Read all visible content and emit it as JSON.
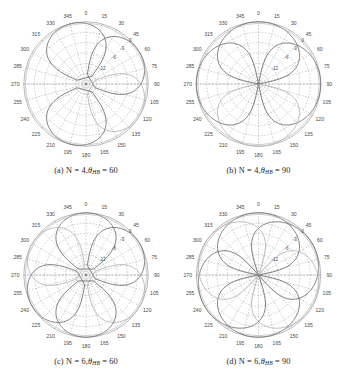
{
  "figure": {
    "panels": [
      {
        "tag": "(a)",
        "caption_text": "(a)  N = 4, θHB = 60",
        "caption_prefix": "(a)",
        "caption_n": "N = 4,",
        "caption_theta": "θ",
        "caption_sub": "HB",
        "caption_value": "= 60",
        "N": 4,
        "theta_HB": 60
      },
      {
        "tag": "(b)",
        "caption_text": "(b)  N = 4, θHB = 90",
        "caption_prefix": "(b)",
        "caption_n": "N = 4,",
        "caption_theta": "θ",
        "caption_sub": "HB",
        "caption_value": "= 90",
        "N": 4,
        "theta_HB": 90
      },
      {
        "tag": "(c)",
        "caption_text": "(c)  N = 6, θHB = 60",
        "caption_prefix": "(c)",
        "caption_n": "N = 6,",
        "caption_theta": "θ",
        "caption_sub": "HB",
        "caption_value": "= 60",
        "N": 6,
        "theta_HB": 60
      },
      {
        "tag": "(d)",
        "caption_text": "(d)  N = 6, θHB = 90",
        "caption_prefix": "(d)",
        "caption_n": "N = 6,",
        "caption_theta": "θ",
        "caption_sub": "HB",
        "caption_value": "= 90",
        "N": 6,
        "theta_HB": 90
      }
    ]
  },
  "chart_data": [
    {
      "type": "line",
      "projection": "polar",
      "title": "(a) N = 4, θHB = 60",
      "xlabel": "",
      "ylabel": "",
      "grid": true,
      "legend": null,
      "angular_unit": "degrees",
      "angular_direction": "clockwise",
      "angular_zero_location": "N",
      "angular_ticks": [
        0,
        15,
        30,
        45,
        60,
        75,
        90,
        105,
        120,
        135,
        150,
        165,
        180,
        195,
        210,
        225,
        240,
        255,
        270,
        285,
        300,
        315,
        330,
        345
      ],
      "radial_ticks_db": [
        0,
        -3,
        -6,
        -12
      ],
      "radial_tick_labels": [
        "0",
        "-3",
        "-6",
        "-12"
      ],
      "radial_label_angle_deg": 45,
      "rlim_db": [
        -20,
        0
      ],
      "series": [
        {
          "name": "beam-1",
          "peak_angle_deg": 345,
          "beamwidth_deg": 60,
          "peak_db": 0
        },
        {
          "name": "beam-2",
          "peak_angle_deg": 60,
          "beamwidth_deg": 60,
          "peak_db": 0
        },
        {
          "name": "beam-3",
          "peak_angle_deg": 120,
          "beamwidth_deg": 60,
          "peak_db": 0
        },
        {
          "name": "beam-4",
          "peak_angle_deg": 195,
          "beamwidth_deg": 60,
          "peak_db": 0
        },
        {
          "name": "composite-envelope",
          "peak_angle_deg": null,
          "beamwidth_deg": null,
          "peak_db": 0
        }
      ]
    },
    {
      "type": "line",
      "projection": "polar",
      "title": "(b) N = 4, θHB = 90",
      "xlabel": "",
      "ylabel": "",
      "grid": true,
      "legend": null,
      "angular_unit": "degrees",
      "angular_direction": "clockwise",
      "angular_zero_location": "N",
      "angular_ticks": [
        0,
        15,
        30,
        45,
        60,
        75,
        90,
        105,
        120,
        135,
        150,
        165,
        180,
        195,
        210,
        225,
        240,
        255,
        270,
        285,
        300,
        315,
        330,
        345
      ],
      "radial_ticks_db": [
        0,
        -3,
        -6,
        -12
      ],
      "radial_tick_labels": [
        "0",
        "-3",
        "-6",
        "-12"
      ],
      "radial_label_angle_deg": 45,
      "rlim_db": [
        -20,
        0
      ],
      "series": [
        {
          "name": "beam-1",
          "peak_angle_deg": 0,
          "beamwidth_deg": 90,
          "peak_db": 0
        },
        {
          "name": "beam-2",
          "peak_angle_deg": 90,
          "beamwidth_deg": 90,
          "peak_db": 0
        },
        {
          "name": "beam-3",
          "peak_angle_deg": 180,
          "beamwidth_deg": 90,
          "peak_db": 0
        },
        {
          "name": "beam-4",
          "peak_angle_deg": 270,
          "beamwidth_deg": 90,
          "peak_db": 0
        },
        {
          "name": "composite-envelope",
          "peak_angle_deg": null,
          "beamwidth_deg": null,
          "peak_db": 0
        }
      ]
    },
    {
      "type": "line",
      "projection": "polar",
      "title": "(c) N = 6, θHB = 60",
      "xlabel": "",
      "ylabel": "",
      "grid": true,
      "legend": null,
      "angular_unit": "degrees",
      "angular_direction": "clockwise",
      "angular_zero_location": "N",
      "angular_ticks": [
        0,
        15,
        30,
        45,
        60,
        75,
        90,
        105,
        120,
        135,
        150,
        165,
        180,
        195,
        210,
        225,
        240,
        255,
        270,
        285,
        300,
        315,
        330,
        345
      ],
      "radial_ticks_db": [
        0,
        -3,
        -6,
        -12
      ],
      "radial_tick_labels": [
        "0",
        "-3",
        "-6",
        "-12"
      ],
      "radial_label_angle_deg": 45,
      "rlim_db": [
        -20,
        0
      ],
      "series": [
        {
          "name": "beam-1",
          "peak_angle_deg": 0,
          "beamwidth_deg": 60,
          "peak_db": 0
        },
        {
          "name": "beam-2",
          "peak_angle_deg": 60,
          "beamwidth_deg": 60,
          "peak_db": 0
        },
        {
          "name": "beam-3",
          "peak_angle_deg": 120,
          "beamwidth_deg": 60,
          "peak_db": 0
        },
        {
          "name": "beam-4",
          "peak_angle_deg": 180,
          "beamwidth_deg": 60,
          "peak_db": 0
        },
        {
          "name": "beam-5",
          "peak_angle_deg": 240,
          "beamwidth_deg": 60,
          "peak_db": 0
        },
        {
          "name": "beam-6",
          "peak_angle_deg": 300,
          "beamwidth_deg": 60,
          "peak_db": 0
        },
        {
          "name": "composite-envelope",
          "peak_angle_deg": null,
          "beamwidth_deg": null,
          "peak_db": 0
        }
      ]
    },
    {
      "type": "line",
      "projection": "polar",
      "title": "(d) N = 6, θHB = 90",
      "xlabel": "",
      "ylabel": "",
      "grid": true,
      "legend": null,
      "angular_unit": "degrees",
      "angular_direction": "clockwise",
      "angular_zero_location": "N",
      "angular_ticks": [
        0,
        15,
        30,
        45,
        60,
        75,
        90,
        105,
        120,
        135,
        150,
        165,
        180,
        195,
        210,
        225,
        240,
        255,
        270,
        285,
        300,
        315,
        330,
        345
      ],
      "radial_ticks_db": [
        0,
        -3,
        -6,
        -12
      ],
      "radial_tick_labels": [
        "0",
        "-3",
        "-6",
        "-12"
      ],
      "radial_label_angle_deg": 45,
      "rlim_db": [
        -20,
        0
      ],
      "series": [
        {
          "name": "beam-1",
          "peak_angle_deg": 0,
          "beamwidth_deg": 90,
          "peak_db": 0
        },
        {
          "name": "beam-2",
          "peak_angle_deg": 60,
          "beamwidth_deg": 90,
          "peak_db": 0
        },
        {
          "name": "beam-3",
          "peak_angle_deg": 120,
          "beamwidth_deg": 90,
          "peak_db": 0
        },
        {
          "name": "beam-4",
          "peak_angle_deg": 180,
          "beamwidth_deg": 90,
          "peak_db": 0
        },
        {
          "name": "beam-5",
          "peak_angle_deg": 240,
          "beamwidth_deg": 90,
          "peak_db": 0
        },
        {
          "name": "beam-6",
          "peak_angle_deg": 300,
          "beamwidth_deg": 90,
          "peak_db": 0
        },
        {
          "name": "composite-envelope",
          "peak_angle_deg": null,
          "beamwidth_deg": null,
          "peak_db": 0
        }
      ]
    }
  ],
  "style": {
    "grid_color": "#8e8e8e",
    "outer_circle_color": "#8a8a8a",
    "curve_color": "#6e6e6e",
    "curve_color_light": "#b4b4b4",
    "tick_label_color": "#4a4a4a",
    "background": "#ffffff"
  }
}
